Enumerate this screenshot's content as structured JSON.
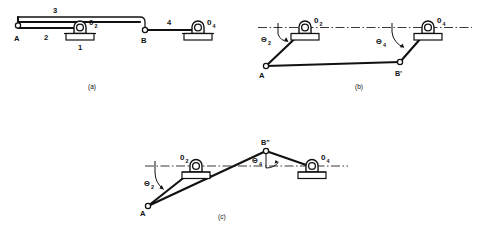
{
  "figure": {
    "background_color": "#ffffff",
    "line_color": "#111111"
  },
  "panels": [
    {
      "id": "a",
      "caption": "(a)",
      "description": "Linkage at reference position with links collinear horizontally",
      "points": [
        {
          "name": "A",
          "label": "A"
        },
        {
          "name": "B",
          "label": "B"
        }
      ],
      "pivots": [
        {
          "name": "O2",
          "label": "0",
          "subscript": "2"
        },
        {
          "name": "O4",
          "label": "0",
          "subscript": "4"
        }
      ],
      "link_numbers": [
        {
          "name": "link-1-ground",
          "label": "1"
        },
        {
          "name": "link-2-crank",
          "label": "2"
        },
        {
          "name": "link-3-coupler",
          "label": "3"
        },
        {
          "name": "link-4-rocker",
          "label": "4"
        }
      ]
    },
    {
      "id": "b",
      "caption": "(b)",
      "description": "Linkage displaced, crank rotated through theta-2 and rocker through theta-4",
      "points": [
        {
          "name": "A",
          "label": "A"
        },
        {
          "name": "B-prime",
          "label": "B'"
        }
      ],
      "pivots": [
        {
          "name": "O2",
          "label": "0",
          "subscript": "2"
        },
        {
          "name": "O4",
          "label": "0",
          "subscript": "4"
        }
      ],
      "angles": [
        {
          "name": "theta-2",
          "label": "Θ",
          "subscript": "2"
        },
        {
          "name": "theta-4",
          "label": "Θ",
          "subscript": "4"
        }
      ]
    },
    {
      "id": "c",
      "caption": "(c)",
      "description": "Linkage in second displaced position, coupler point raised above the centre line",
      "points": [
        {
          "name": "A",
          "label": "A"
        },
        {
          "name": "B-double-prime",
          "label": "B\""
        }
      ],
      "pivots": [
        {
          "name": "O2",
          "label": "0",
          "subscript": "2"
        },
        {
          "name": "O4",
          "label": "0",
          "subscript": "4"
        }
      ],
      "angles": [
        {
          "name": "theta-2",
          "label": "Θ",
          "subscript": "2"
        },
        {
          "name": "theta-4",
          "label": "Θ",
          "subscript": "4"
        }
      ]
    }
  ]
}
